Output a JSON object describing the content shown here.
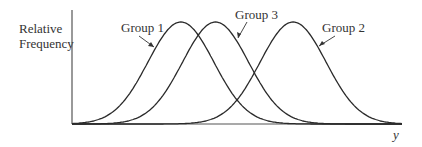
{
  "chart_data": {
    "type": "line",
    "title": "",
    "xlabel": "y",
    "ylabel": "Relative Frequency",
    "grid": false,
    "legend": "inline annotations with arrows",
    "x_range": [
      0,
      10
    ],
    "y_range": [
      0,
      1
    ],
    "series": [
      {
        "name": "Group 1",
        "distribution": "normal",
        "mean": 3.3,
        "sd": 1.0,
        "peak_height": 1.0
      },
      {
        "name": "Group 3",
        "distribution": "normal",
        "mean": 4.35,
        "sd": 1.0,
        "peak_height": 1.0
      },
      {
        "name": "Group 2",
        "distribution": "normal",
        "mean": 6.7,
        "sd": 1.0,
        "peak_height": 1.0
      }
    ],
    "annotations": [
      "Group 1",
      "Group 3",
      "Group 2"
    ]
  },
  "labels": {
    "ylabel_line1": "Relative",
    "ylabel_line2": "Frequency",
    "xlabel": "y",
    "group1": "Group 1",
    "group2": "Group 2",
    "group3": "Group 3"
  },
  "colors": {
    "curve": "#2a2a2a",
    "axis": "#555555",
    "text": "#333333"
  }
}
